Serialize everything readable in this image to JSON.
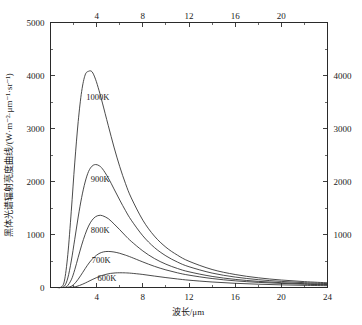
{
  "chart_data": {
    "type": "line",
    "title": "",
    "xlabel": "波长/μm",
    "ylabel": "黑体光谱辐射亮度曲线/(W·m⁻²·μm⁻¹·sr⁻¹)",
    "xlim": [
      0,
      24
    ],
    "ylim": [
      0,
      5000
    ],
    "grid": false,
    "legend": "inline-curve-labels",
    "x_ticks_major": [
      0,
      4,
      8,
      12,
      16,
      20,
      24
    ],
    "x_tick_labels_bottom": [
      "",
      "4",
      "8",
      "12",
      "16",
      "20",
      "24"
    ],
    "x_tick_labels_top": [
      "",
      "4",
      "8",
      "12",
      "16",
      "20",
      ""
    ],
    "x_ticks_minor": [
      2,
      6,
      10,
      14,
      18,
      22
    ],
    "y_ticks_major": [
      0,
      1000,
      2000,
      3000,
      4000,
      5000
    ],
    "y_tick_labels_left": [
      "0",
      "1000",
      "2000",
      "3000",
      "4000",
      "5000"
    ],
    "y_tick_labels_right": [
      "",
      "1000",
      "2000",
      "3000",
      "4000",
      ""
    ],
    "y_ticks_minor": [
      500,
      1500,
      2500,
      3500,
      4500
    ],
    "series": [
      {
        "name": "1000K",
        "label": "1000K",
        "temperature_k": 1000,
        "peak_wavelength_um": 3.5,
        "peak_value": 4080,
        "label_x_um": 4.1,
        "label_y_value": 3530,
        "x": [
          0.6,
          0.9,
          1.2,
          1.5,
          1.8,
          2.1,
          2.4,
          2.7,
          3.0,
          3.3,
          3.6,
          3.9,
          4.2,
          4.5,
          5.0,
          5.5,
          6.0,
          6.5,
          7.0,
          8.0,
          9.0,
          10.0,
          11.0,
          12.0,
          14.0,
          16.0,
          18.0,
          20.0,
          22.0,
          24.0
        ],
        "values": [
          0,
          5,
          120,
          620,
          1440,
          2350,
          3130,
          3700,
          4010,
          4080,
          4070,
          3930,
          3720,
          3480,
          3060,
          2650,
          2280,
          1960,
          1690,
          1270,
          970,
          760,
          610,
          495,
          340,
          245,
          183,
          141,
          111,
          89
        ]
      },
      {
        "name": "900K",
        "label": "900K",
        "temperature_k": 900,
        "peak_wavelength_um": 3.9,
        "peak_value": 2320,
        "label_x_um": 4.3,
        "label_y_value": 1990,
        "x": [
          0.8,
          1.2,
          1.5,
          1.8,
          2.1,
          2.4,
          2.7,
          3.0,
          3.3,
          3.6,
          3.9,
          4.2,
          4.5,
          5.0,
          5.5,
          6.0,
          6.5,
          7.0,
          8.0,
          9.0,
          10.0,
          11.0,
          12.0,
          14.0,
          16.0,
          18.0,
          20.0,
          22.0,
          24.0
        ],
        "values": [
          0,
          24,
          180,
          500,
          910,
          1330,
          1700,
          1990,
          2190,
          2290,
          2320,
          2300,
          2240,
          2070,
          1860,
          1650,
          1450,
          1270,
          975,
          755,
          597,
          480,
          392,
          272,
          197,
          148,
          115,
          91,
          73
        ]
      },
      {
        "name": "800K",
        "label": "800K",
        "temperature_k": 800,
        "peak_wavelength_um": 4.4,
        "peak_value": 1360,
        "label_x_um": 4.3,
        "label_y_value": 1030,
        "x": [
          1.0,
          1.4,
          1.8,
          2.1,
          2.4,
          2.7,
          3.0,
          3.3,
          3.6,
          3.9,
          4.2,
          4.5,
          5.0,
          5.5,
          6.0,
          6.5,
          7.0,
          8.0,
          9.0,
          10.0,
          11.0,
          12.0,
          14.0,
          16.0,
          18.0,
          20.0,
          22.0,
          24.0
        ],
        "values": [
          0,
          18,
          145,
          335,
          570,
          800,
          1000,
          1160,
          1270,
          1335,
          1360,
          1355,
          1300,
          1200,
          1090,
          975,
          870,
          690,
          547,
          440,
          359,
          296,
          209,
          153,
          116,
          91,
          72,
          58
        ]
      },
      {
        "name": "700K",
        "label": "700K",
        "temperature_k": 700,
        "peak_wavelength_um": 5.0,
        "peak_value": 680,
        "label_x_um": 4.4,
        "label_y_value": 455,
        "x": [
          1.3,
          1.8,
          2.2,
          2.6,
          3.0,
          3.4,
          3.8,
          4.2,
          4.6,
          5.0,
          5.5,
          6.0,
          6.5,
          7.0,
          8.0,
          9.0,
          10.0,
          11.0,
          12.0,
          14.0,
          16.0,
          18.0,
          20.0,
          22.0,
          24.0
        ],
        "values": [
          0,
          22,
          100,
          220,
          355,
          480,
          575,
          640,
          672,
          680,
          670,
          645,
          610,
          570,
          482,
          400,
          332,
          277,
          233,
          169,
          126,
          97,
          77,
          62,
          50
        ]
      },
      {
        "name": "600K",
        "label": "600K",
        "temperature_k": 600,
        "peak_wavelength_um": 5.9,
        "peak_value": 278,
        "label_x_um": 4.9,
        "label_y_value": 130,
        "x": [
          1.6,
          2.2,
          2.8,
          3.2,
          3.6,
          4.0,
          4.4,
          4.8,
          5.2,
          5.6,
          6.0,
          6.5,
          7.0,
          8.0,
          9.0,
          10.0,
          11.0,
          12.0,
          14.0,
          16.0,
          18.0,
          20.0,
          22.0,
          24.0
        ],
        "values": [
          0,
          16,
          64,
          105,
          148,
          188,
          222,
          248,
          266,
          275,
          278,
          276,
          269,
          246,
          216,
          187,
          161,
          138,
          104,
          79,
          62,
          50,
          41,
          34
        ]
      }
    ]
  }
}
